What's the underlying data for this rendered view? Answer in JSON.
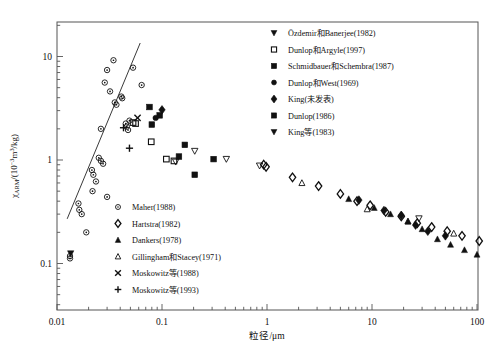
{
  "chart_data": {
    "type": "scatter",
    "title": "",
    "xlabel": "粒径/μm",
    "ylabel": "χARM/(10−3m3/kg)",
    "ylabel_parts": {
      "chi": "χ",
      "sub": "ARM",
      "slash": "/(10",
      "exp": "−3",
      "unit_m": "m",
      "unit_exp": "3",
      "tail": "/kg)"
    },
    "xscale": "log",
    "yscale": "log",
    "xlim": [
      0.01,
      200
    ],
    "ylim": [
      0.05,
      20
    ],
    "grid": false,
    "xticks": [
      "0.01",
      "0.1",
      "1",
      "10",
      "100"
    ],
    "xtick_values": [
      0.01,
      0.1,
      1,
      10,
      100
    ],
    "yticks": [
      "10",
      "1",
      "0.1"
    ],
    "ytick_values": [
      10,
      1,
      0.1
    ],
    "trendline": {
      "x0": 0.0125,
      "y0": 0.27,
      "x1": 0.062,
      "y1": 13.5
    },
    "series": [
      {
        "name": "Maher(1988)",
        "marker": "circle-open-dot",
        "points": [
          [
            0.0133,
            0.118
          ],
          [
            0.0133,
            0.112
          ],
          [
            0.016,
            0.38
          ],
          [
            0.0163,
            0.33
          ],
          [
            0.0172,
            0.3
          ],
          [
            0.019,
            0.2
          ],
          [
            0.0215,
            0.8
          ],
          [
            0.0222,
            0.72
          ],
          [
            0.0235,
            0.62
          ],
          [
            0.025,
            1.05
          ],
          [
            0.0262,
            0.98
          ],
          [
            0.0275,
            0.92
          ],
          [
            0.0262,
            2.0
          ],
          [
            0.0285,
            5.6
          ],
          [
            0.03,
            7.4
          ],
          [
            0.032,
            4.6
          ],
          [
            0.0345,
            9.2
          ],
          [
            0.0355,
            3.6
          ],
          [
            0.0368,
            3.42
          ],
          [
            0.041,
            4.1
          ],
          [
            0.0418,
            3.95
          ],
          [
            0.0452,
            2.25
          ],
          [
            0.0462,
            2.1
          ],
          [
            0.0475,
            1.95
          ],
          [
            0.049,
            2.4
          ],
          [
            0.053,
            7.8
          ],
          [
            0.064,
            5.3
          ],
          [
            0.03,
            0.44
          ],
          [
            0.0218,
            0.5
          ]
        ]
      },
      {
        "name": "Hartstra(1982)",
        "marker": "diamond-open",
        "points": [
          [
            1.75,
            0.68
          ],
          [
            3.1,
            0.56
          ],
          [
            5.0,
            0.47
          ],
          [
            7.2,
            0.4
          ],
          [
            9.6,
            0.365
          ],
          [
            13.5,
            0.315
          ],
          [
            19.0,
            0.285
          ],
          [
            27.0,
            0.245
          ],
          [
            37.0,
            0.225
          ],
          [
            52.0,
            0.205
          ],
          [
            72.0,
            0.185
          ],
          [
            105.0,
            0.165
          ],
          [
            150.0,
            0.155
          ],
          [
            190.0,
            0.15
          ],
          [
            0.93,
            0.9
          ],
          [
            0.98,
            0.86
          ]
        ]
      },
      {
        "name": "Dankers(1978)",
        "marker": "triangle-filled",
        "points": [
          [
            6.0,
            0.42
          ],
          [
            10.5,
            0.345
          ],
          [
            15.0,
            0.3
          ],
          [
            22.0,
            0.255
          ],
          [
            30.0,
            0.215
          ],
          [
            42.0,
            0.172
          ],
          [
            56.0,
            0.152
          ],
          [
            76.0,
            0.135
          ],
          [
            100.0,
            0.122
          ],
          [
            140.0,
            0.11
          ],
          [
            185.0,
            0.098
          ],
          [
            125.0,
            0.092
          ]
        ]
      },
      {
        "name": "Gillingham和Stacey(1971)",
        "marker": "triangle-open",
        "points": [
          [
            2.15,
            0.6
          ],
          [
            9.0,
            0.335
          ],
          [
            22.0,
            0.255
          ],
          [
            60.0,
            0.195
          ],
          [
            150.0,
            0.172
          ]
        ]
      },
      {
        "name": "Moskowitz等(1988)",
        "marker": "cross-x",
        "points": [
          [
            0.0585,
            2.55
          ]
        ]
      },
      {
        "name": "Moskowitz等(1993)",
        "marker": "plus",
        "points": [
          [
            0.049,
            1.3
          ],
          [
            0.043,
            2.05
          ]
        ]
      },
      {
        "name": "Özdemir和Banerjee(1982)",
        "marker": "triangle-down-filled",
        "points": [
          [
            0.0135,
            0.125
          ]
        ]
      },
      {
        "name": "Dunlop和Argyle(1997)",
        "marker": "square-open",
        "points": [
          [
            0.053,
            2.3
          ],
          [
            0.056,
            2.25
          ],
          [
            0.079,
            1.5
          ],
          [
            0.11,
            1.02
          ],
          [
            0.13,
            0.98
          ]
        ]
      },
      {
        "name": "Schmidbauer和Schembra(1987)",
        "marker": "square-filled",
        "points": [
          [
            0.076,
            3.25
          ],
          [
            0.08,
            2.2
          ],
          [
            0.095,
            2.7
          ],
          [
            0.145,
            1.08
          ],
          [
            0.205,
            0.72
          ]
        ]
      },
      {
        "name": "Dunlop和West(1969)",
        "marker": "circle-filled",
        "points": [
          [
            0.087,
            2.55
          ]
        ]
      },
      {
        "name": "King(未发表)",
        "marker": "diamond-filled",
        "points": [
          [
            0.1,
            3.05
          ],
          [
            7.5,
            0.41
          ],
          [
            13.0,
            0.325
          ],
          [
            19.0,
            0.292
          ],
          [
            26.0,
            0.235
          ],
          [
            34.0,
            0.205
          ],
          [
            50.0,
            0.185
          ]
        ]
      },
      {
        "name": "Dunlop(1986)",
        "marker": "square-filled",
        "points": [
          [
            0.165,
            1.4
          ],
          [
            0.31,
            1.02
          ]
        ]
      },
      {
        "name": "King等(1983)",
        "marker": "triangle-down-open",
        "points": [
          [
            0.135,
            0.96
          ],
          [
            0.205,
            1.22
          ],
          [
            0.41,
            1.02
          ],
          [
            0.85,
            0.88
          ],
          [
            28.0,
            0.272
          ]
        ]
      }
    ]
  },
  "legend_upper": {
    "position": "top-right",
    "items": [
      {
        "marker": "triangle-down-filled",
        "label": "Özdemir和Banerjee(1982)"
      },
      {
        "marker": "square-open",
        "label": "Dunlop和Argyle(1997)"
      },
      {
        "marker": "square-filled",
        "label": "Schmidbauer和Schembra(1987)"
      },
      {
        "marker": "circle-filled",
        "label": "Dunlop和West(1969)"
      },
      {
        "marker": "diamond-filled",
        "label": "King(未发表)"
      },
      {
        "marker": "square-filled",
        "label": "Dunlop(1986)"
      },
      {
        "marker": "triangle-down-filled",
        "label": "King等(1983)"
      }
    ]
  },
  "legend_lower": {
    "position": "bottom-left-inside",
    "items": [
      {
        "marker": "circle-open-dot",
        "label": "Maher(1988)"
      },
      {
        "marker": "diamond-open",
        "label": "Hartstra(1982)"
      },
      {
        "marker": "triangle-filled",
        "label": "Dankers(1978)"
      },
      {
        "marker": "triangle-open",
        "label": "Gillingham和Stacey(1971)"
      },
      {
        "marker": "cross-x",
        "label": "Moskowitz等(1988)"
      },
      {
        "marker": "plus",
        "label": "Moskowitz等(1993)"
      }
    ]
  },
  "colors": {
    "ink": "#111111",
    "frame": "#555555",
    "background": "#ffffff"
  }
}
